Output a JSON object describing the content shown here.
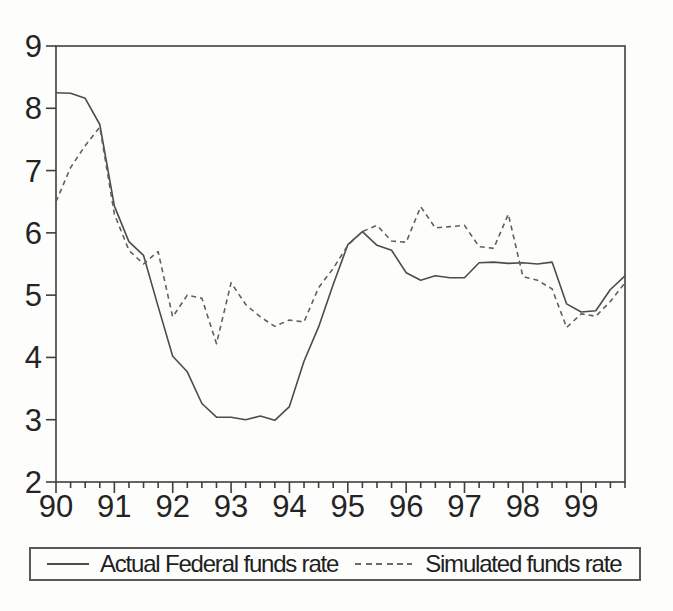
{
  "figure": {
    "background": "#fdfdfc",
    "axis_color": "#3f3f3f",
    "solid_line_color": "#4c4c4c",
    "dashed_line_color": "#606060",
    "text_color": "#242424"
  },
  "chart_data": {
    "type": "line",
    "title": "",
    "xlabel": "",
    "ylabel": "",
    "x_frequency": "quarterly",
    "x_range": [
      "1990Q1",
      "1999Q4"
    ],
    "x_tick_labels": [
      "90",
      "91",
      "92",
      "93",
      "94",
      "95",
      "96",
      "97",
      "98",
      "99"
    ],
    "ylim": [
      2,
      9
    ],
    "yticks": [
      2,
      3,
      4,
      5,
      6,
      7,
      8,
      9
    ],
    "grid": false,
    "legend_position": "bottom-boxed",
    "quarters": [
      "1990Q1",
      "1990Q2",
      "1990Q3",
      "1990Q4",
      "1991Q1",
      "1991Q2",
      "1991Q3",
      "1991Q4",
      "1992Q1",
      "1992Q2",
      "1992Q3",
      "1992Q4",
      "1993Q1",
      "1993Q2",
      "1993Q3",
      "1993Q4",
      "1994Q1",
      "1994Q2",
      "1994Q3",
      "1994Q4",
      "1995Q1",
      "1995Q2",
      "1995Q3",
      "1995Q4",
      "1996Q1",
      "1996Q2",
      "1996Q3",
      "1996Q4",
      "1997Q1",
      "1997Q2",
      "1997Q3",
      "1997Q4",
      "1998Q1",
      "1998Q2",
      "1998Q3",
      "1998Q4",
      "1999Q1",
      "1999Q2",
      "1999Q3",
      "1999Q4"
    ],
    "series": [
      {
        "name": "Actual Federal funds rate",
        "style": "solid",
        "values": [
          8.25,
          8.24,
          8.16,
          7.74,
          6.43,
          5.86,
          5.64,
          4.82,
          4.02,
          3.77,
          3.26,
          3.04,
          3.04,
          3.0,
          3.06,
          2.99,
          3.21,
          3.94,
          4.49,
          5.17,
          5.81,
          6.02,
          5.8,
          5.72,
          5.36,
          5.24,
          5.31,
          5.28,
          5.28,
          5.52,
          5.53,
          5.51,
          5.52,
          5.5,
          5.53,
          4.86,
          4.73,
          4.75,
          5.09,
          5.31
        ]
      },
      {
        "name": "Simulated funds rate",
        "style": "dashed",
        "values": [
          6.5,
          7.05,
          7.4,
          7.7,
          6.3,
          5.72,
          5.5,
          5.7,
          4.65,
          5.0,
          4.95,
          4.22,
          5.2,
          4.85,
          4.65,
          4.5,
          4.6,
          4.57,
          5.12,
          5.43,
          5.8,
          6.02,
          6.12,
          5.87,
          5.85,
          6.42,
          6.08,
          6.1,
          6.12,
          5.78,
          5.75,
          6.3,
          5.3,
          5.24,
          5.1,
          4.48,
          4.7,
          4.66,
          4.9,
          5.2
        ]
      }
    ]
  },
  "legend": {
    "items": [
      {
        "label": "Actual Federal funds rate",
        "line_style": "solid"
      },
      {
        "label": "Simulated funds rate",
        "line_style": "dashed"
      }
    ]
  }
}
